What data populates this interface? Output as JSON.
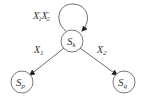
{
  "diagram": {
    "type": "state-transition",
    "nodes": [
      {
        "id": "sk",
        "label": "S",
        "sub": "k"
      },
      {
        "id": "sp",
        "label": "S",
        "sub": "p"
      },
      {
        "id": "sq",
        "label": "S",
        "sub": "q"
      }
    ],
    "edges": [
      {
        "from": "sk",
        "to": "sk",
        "label": "X'₁X'₂",
        "kind": "self-loop"
      },
      {
        "from": "sk",
        "to": "sp",
        "label": "X",
        "sub": "1"
      },
      {
        "from": "sk",
        "to": "sq",
        "label": "X",
        "sub": "2"
      }
    ],
    "loop_label": {
      "a": "X",
      "a_prime": "'",
      "a_sub": "1",
      "b": "X",
      "b_prime": "'",
      "b_sub": "2"
    },
    "colors": {
      "stroke": "#555555",
      "text": "#333333",
      "background": "#ffffff"
    }
  }
}
